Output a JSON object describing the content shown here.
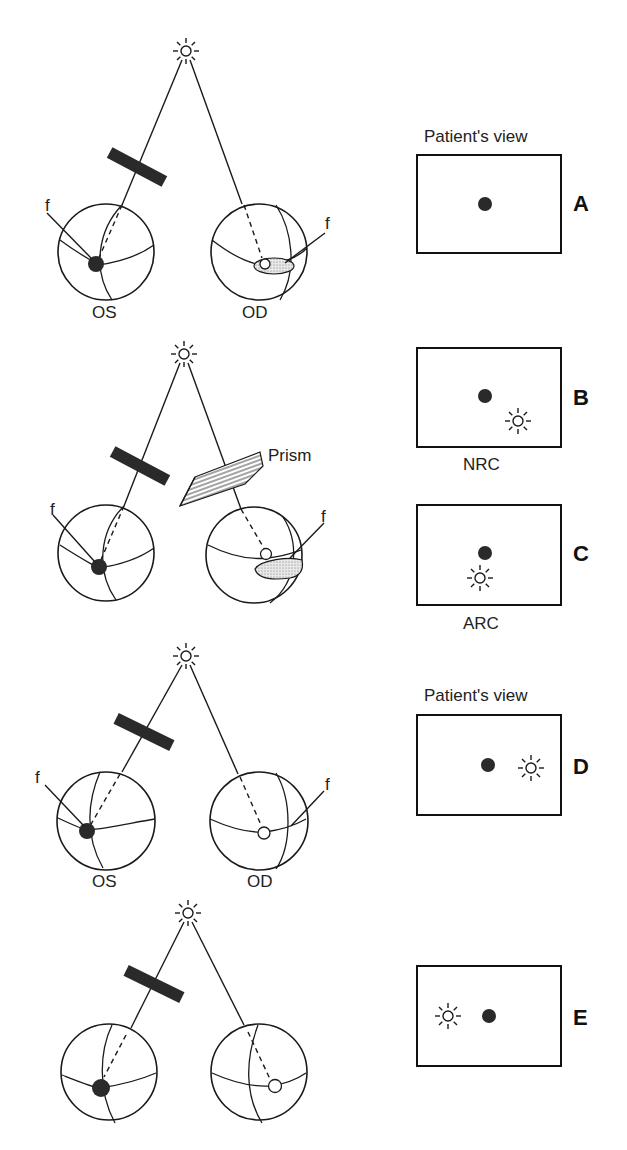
{
  "figure": {
    "labels": {
      "patients_view": "Patient's view",
      "fovea": "f",
      "left_eye": "OS",
      "right_eye": "OD",
      "prism": "Prism",
      "nrc": "NRC",
      "arc": "ARC"
    },
    "panels": [
      {
        "id": "A",
        "letter": "A",
        "title": "Patient's view",
        "dot": [
          485,
          204
        ],
        "light": null
      },
      {
        "id": "B",
        "letter": "B",
        "title": "",
        "dot": [
          485,
          396
        ],
        "light": [
          518,
          421
        ],
        "caption": "NRC"
      },
      {
        "id": "C",
        "letter": "C",
        "title": "",
        "dot": [
          485,
          553
        ],
        "light": [
          480,
          578
        ],
        "caption": "ARC"
      },
      {
        "id": "D",
        "letter": "D",
        "title": "Patient's view",
        "dot": [
          488,
          765
        ],
        "light": [
          531,
          768
        ]
      },
      {
        "id": "E",
        "letter": "E",
        "title": "",
        "dot": [
          489,
          1016
        ],
        "light": [
          448,
          1016
        ]
      }
    ],
    "icons": {
      "light_source": "light-source-icon",
      "fixation_dot": "fixation-dot-icon",
      "occluder": "red-filter-bar",
      "eye": "eyeball-icon"
    },
    "colors": {
      "ink": "#1a1a1a",
      "background": "#ffffff",
      "fill_dark": "#2a2a2a",
      "hatch": "#9a9a9a"
    }
  }
}
